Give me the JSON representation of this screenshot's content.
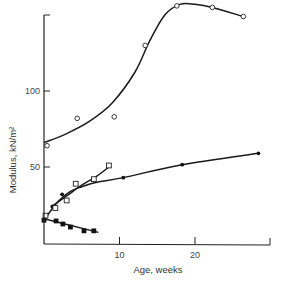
{
  "chart_data": {
    "type": "line",
    "title": "",
    "xlabel": "Age, weeks",
    "ylabel": "Modulus, kN/m²",
    "xlim": [
      0,
      30
    ],
    "ylim": [
      0,
      155
    ],
    "x_ticks": [
      10,
      20
    ],
    "y_ticks": [
      50,
      100
    ],
    "grid": false,
    "legend": null,
    "series": [
      {
        "name": "open-circles",
        "marker": "open-circle",
        "points": [
          [
            0.4,
            64
          ],
          [
            4.4,
            82
          ],
          [
            9.3,
            83
          ],
          [
            13.4,
            130
          ],
          [
            17.6,
            156
          ],
          [
            22.3,
            155
          ],
          [
            26.4,
            149
          ]
        ],
        "curve": [
          [
            0,
            66
          ],
          [
            3,
            72
          ],
          [
            6,
            80
          ],
          [
            9,
            92
          ],
          [
            12,
            112
          ],
          [
            14,
            133
          ],
          [
            16,
            150
          ],
          [
            18,
            157
          ],
          [
            20,
            157
          ],
          [
            22.3,
            155
          ],
          [
            26.4,
            149
          ]
        ]
      },
      {
        "name": "filled-circles",
        "marker": "filled-circle",
        "points": [
          [
            1.1,
            24
          ],
          [
            2.4,
            32
          ],
          [
            10.5,
            43
          ],
          [
            18.3,
            51.5
          ],
          [
            28.4,
            59
          ]
        ],
        "curve": [
          [
            0.2,
            16
          ],
          [
            1,
            22
          ],
          [
            2,
            28
          ],
          [
            3.5,
            34
          ],
          [
            5,
            37
          ],
          [
            7,
            40
          ],
          [
            10.5,
            43
          ],
          [
            18.3,
            51.5
          ],
          [
            28.4,
            59
          ]
        ]
      },
      {
        "name": "open-squares",
        "marker": "open-square",
        "points": [
          [
            0.2,
            18
          ],
          [
            1.5,
            23
          ],
          [
            3.0,
            28
          ],
          [
            4.2,
            39
          ],
          [
            6.6,
            42
          ],
          [
            8.6,
            51
          ]
        ],
        "curve": [
          [
            1,
            24
          ],
          [
            3,
            31
          ],
          [
            5,
            38
          ],
          [
            7,
            44
          ],
          [
            8.6,
            50
          ]
        ]
      },
      {
        "name": "filled-squares",
        "marker": "filled-square",
        "points": [
          [
            0,
            15
          ],
          [
            1.6,
            14.5
          ],
          [
            2.5,
            12.5
          ],
          [
            3.5,
            10.5
          ],
          [
            5.3,
            8
          ],
          [
            6.6,
            8
          ]
        ],
        "curve": [
          [
            0,
            16
          ],
          [
            7.2,
            7
          ]
        ]
      }
    ]
  }
}
